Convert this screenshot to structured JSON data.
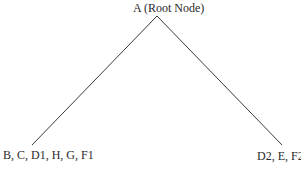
{
  "diagram": {
    "type": "tree",
    "root": {
      "label": "A (Root Node)"
    },
    "children": [
      {
        "label": "B, C, D1, H, G, F1"
      },
      {
        "label": "D2, E, F2"
      }
    ]
  }
}
